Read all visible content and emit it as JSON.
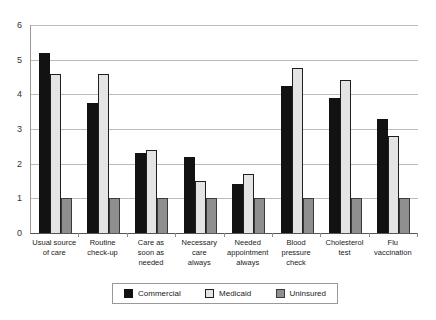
{
  "chart_data": {
    "type": "bar",
    "title": "",
    "xlabel": "",
    "ylabel": "",
    "ylim": [
      0,
      6
    ],
    "yticks": [
      0,
      1,
      2,
      3,
      4,
      5,
      6
    ],
    "grid": true,
    "legend_position": "bottom",
    "categories": [
      "Usual source\nof care",
      "Routine\ncheck-up",
      "Care as\nsoon as\nneeded",
      "Necessary\ncare\nalways",
      "Needed\nappointment\nalways",
      "Blood\npressure\ncheck",
      "Cholesterol\ntest",
      "Flu\nvaccination"
    ],
    "series": [
      {
        "name": "Commercial",
        "color": "#121212",
        "border_color": "#121212",
        "values": [
          5.2,
          3.75,
          2.3,
          2.2,
          1.4,
          4.25,
          3.9,
          3.3
        ]
      },
      {
        "name": "Medicaid",
        "color": "#e4e4e4",
        "border_color": "#1f1f1f",
        "values": [
          4.6,
          4.6,
          2.4,
          1.5,
          1.7,
          4.75,
          4.4,
          2.8
        ]
      },
      {
        "name": "Uninsured",
        "color": "#8f8f8f",
        "border_color": "#3a3a3a",
        "values": [
          1.0,
          1.0,
          1.0,
          1.0,
          1.0,
          1.0,
          1.0,
          1.0
        ]
      }
    ]
  },
  "legend": {
    "items": [
      {
        "label": "Commercial"
      },
      {
        "label": "Medicaid"
      },
      {
        "label": "Uninsured"
      }
    ]
  },
  "colors": {
    "gridline": "#bcbcbc",
    "axis": "#555555",
    "background": "#ffffff"
  }
}
